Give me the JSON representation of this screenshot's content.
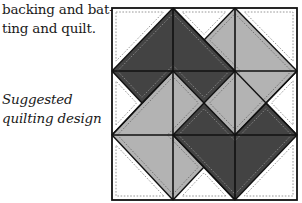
{
  "body_text": {
    "line1": "backing and bat-",
    "line2": "ting and quilt."
  },
  "caption": {
    "line1": "Suggested",
    "line2": "quilting design"
  },
  "quilt": {
    "colors": {
      "dark": "#434343",
      "light": "#b3b3b3",
      "white": "#ffffff",
      "line": "#111111",
      "dash_on_dark": "#8a8a8a",
      "dash_on_light": "#6e6e6e",
      "dash_on_white": "#8c8c8c"
    },
    "frame": {
      "x1": 112,
      "y1": 8,
      "x2": 297,
      "y2": 200
    },
    "grid_x": [
      173,
      235
    ],
    "grid_y": [
      71,
      135
    ],
    "shapes": [
      {
        "name": "dark-top-patch",
        "fill": "dark",
        "points": [
          [
            112,
            71
          ],
          [
            173,
            8
          ],
          [
            235,
            71
          ],
          [
            204,
            103
          ],
          [
            173,
            71
          ],
          [
            142,
            103
          ]
        ]
      },
      {
        "name": "light-right-patch",
        "fill": "light",
        "points": [
          [
            235,
            8
          ],
          [
            297,
            71
          ],
          [
            235,
            135
          ],
          [
            204,
            103
          ],
          [
            235,
            71
          ],
          [
            204,
            40
          ]
        ]
      },
      {
        "name": "dark-bottom-patch",
        "fill": "dark",
        "points": [
          [
            297,
            135
          ],
          [
            235,
            200
          ],
          [
            173,
            135
          ],
          [
            204,
            103
          ],
          [
            235,
            135
          ],
          [
            266,
            103
          ]
        ]
      },
      {
        "name": "light-left-patch",
        "fill": "light",
        "points": [
          [
            173,
            200
          ],
          [
            112,
            135
          ],
          [
            173,
            71
          ],
          [
            204,
            103
          ],
          [
            173,
            135
          ],
          [
            204,
            167
          ]
        ]
      },
      {
        "name": "white-corner-top-left",
        "fill": "white",
        "points": [
          [
            112,
            8
          ],
          [
            173,
            8
          ],
          [
            112,
            71
          ]
        ]
      },
      {
        "name": "white-edge-top",
        "fill": "white",
        "points": [
          [
            173,
            8
          ],
          [
            235,
            8
          ],
          [
            204,
            40
          ]
        ]
      },
      {
        "name": "white-corner-top-right",
        "fill": "white",
        "points": [
          [
            235,
            8
          ],
          [
            297,
            8
          ],
          [
            297,
            71
          ]
        ]
      },
      {
        "name": "white-edge-right",
        "fill": "white",
        "points": [
          [
            297,
            71
          ],
          [
            297,
            135
          ],
          [
            266,
            103
          ]
        ]
      },
      {
        "name": "white-corner-bottom-right",
        "fill": "white",
        "points": [
          [
            297,
            135
          ],
          [
            297,
            200
          ],
          [
            235,
            200
          ]
        ]
      },
      {
        "name": "white-edge-bottom",
        "fill": "white",
        "points": [
          [
            235,
            200
          ],
          [
            173,
            200
          ],
          [
            204,
            167
          ]
        ]
      },
      {
        "name": "white-corner-bottom-left",
        "fill": "white",
        "points": [
          [
            173,
            200
          ],
          [
            112,
            200
          ],
          [
            112,
            135
          ]
        ]
      },
      {
        "name": "white-edge-left",
        "fill": "white",
        "points": [
          [
            112,
            135
          ],
          [
            112,
            71
          ],
          [
            142,
            103
          ]
        ]
      }
    ],
    "seam_lines": [
      [
        [
          112,
          71
        ],
        [
          173,
          8
        ]
      ],
      [
        [
          173,
          8
        ],
        [
          235,
          71
        ]
      ],
      [
        [
          235,
          8
        ],
        [
          297,
          71
        ]
      ],
      [
        [
          297,
          71
        ],
        [
          235,
          135
        ]
      ],
      [
        [
          297,
          135
        ],
        [
          235,
          200
        ]
      ],
      [
        [
          235,
          200
        ],
        [
          173,
          135
        ]
      ],
      [
        [
          173,
          200
        ],
        [
          112,
          135
        ]
      ],
      [
        [
          112,
          135
        ],
        [
          173,
          71
        ]
      ],
      [
        [
          112,
          71
        ],
        [
          142,
          103
        ]
      ],
      [
        [
          142,
          103
        ],
        [
          173,
          71
        ]
      ],
      [
        [
          173,
          71
        ],
        [
          204,
          103
        ]
      ],
      [
        [
          204,
          103
        ],
        [
          235,
          71
        ]
      ],
      [
        [
          204,
          40
        ],
        [
          235,
          8
        ]
      ],
      [
        [
          204,
          40
        ],
        [
          235,
          71
        ]
      ],
      [
        [
          235,
          71
        ],
        [
          266,
          103
        ]
      ],
      [
        [
          266,
          103
        ],
        [
          297,
          135
        ]
      ],
      [
        [
          204,
          103
        ],
        [
          235,
          135
        ]
      ],
      [
        [
          235,
          135
        ],
        [
          266,
          103
        ]
      ],
      [
        [
          266,
          103
        ],
        [
          297,
          71
        ]
      ],
      [
        [
          173,
          135
        ],
        [
          204,
          103
        ]
      ],
      [
        [
          173,
          200
        ],
        [
          204,
          167
        ]
      ],
      [
        [
          204,
          167
        ],
        [
          235,
          200
        ]
      ],
      [
        [
          204,
          167
        ],
        [
          173,
          135
        ]
      ],
      [
        [
          112,
          135
        ],
        [
          142,
          103
        ]
      ],
      [
        [
          173,
          8
        ],
        [
          204,
          40
        ]
      ],
      [
        [
          266,
          103
        ],
        [
          297,
          135
        ]
      ]
    ],
    "dash_inset": 4
  }
}
